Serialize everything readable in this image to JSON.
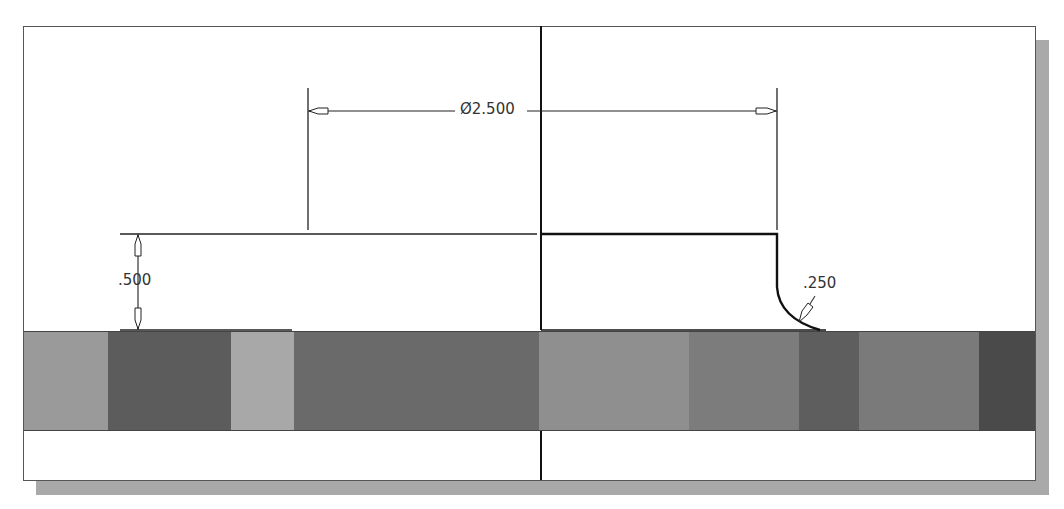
{
  "drawing": {
    "dimensions": {
      "diameter": {
        "label": "Ø2.500"
      },
      "height": {
        "label": ".500"
      },
      "fillet_radius": {
        "label": ".250"
      }
    },
    "band_segments": [
      {
        "width": 84,
        "color": "#9a9a9a"
      },
      {
        "width": 123,
        "color": "#5c5c5c"
      },
      {
        "width": 63,
        "color": "#a8a8a8"
      },
      {
        "width": 245,
        "color": "#6a6a6a"
      },
      {
        "width": 150,
        "color": "#8f8f8f"
      },
      {
        "width": 110,
        "color": "#7c7c7c"
      },
      {
        "width": 60,
        "color": "#5e5e5e"
      },
      {
        "width": 120,
        "color": "#7a7a7a"
      },
      {
        "width": 56,
        "color": "#4a4a4a"
      }
    ],
    "colors": {
      "line": "#222222",
      "frame_border": "#555555",
      "shadow": "#a9a9a9"
    }
  }
}
